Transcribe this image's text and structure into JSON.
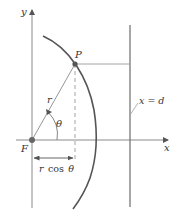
{
  "diagram": {
    "type": "conic-section-polar-focus-directrix",
    "labels": {
      "y_axis": "y",
      "x_axis": "x",
      "focus": "F",
      "point": "P",
      "radius": "r",
      "angle": "θ",
      "directrix": "x = d",
      "projection_r": "r",
      "projection_cos": "cos",
      "projection_theta": "θ"
    },
    "colors": {
      "axis": "#8a8a8a",
      "curve": "#555555",
      "directrix": "#777777",
      "guide": "#9a9a9a",
      "point": "#555555",
      "text": "#333333"
    }
  }
}
